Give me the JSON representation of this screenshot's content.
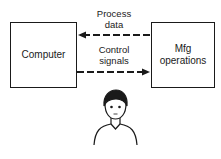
{
  "diagram": {
    "nodes": {
      "computer": {
        "label": "Computer"
      },
      "mfg": {
        "label_line1": "Mfg",
        "label_line2": "operations"
      }
    },
    "edges": [
      {
        "from": "mfg",
        "to": "computer",
        "label_line1": "Process",
        "label_line2": "data",
        "style": "dashed"
      },
      {
        "from": "computer",
        "to": "mfg",
        "label_line1": "Control",
        "label_line2": "signals",
        "style": "dashed"
      }
    ],
    "figure": {
      "name": "human operator"
    }
  }
}
